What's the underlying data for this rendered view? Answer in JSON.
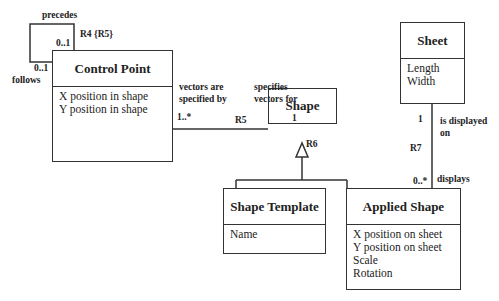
{
  "classes": {
    "control_point": {
      "name": "Control Point",
      "attributes": [
        "X position in shape",
        "Y position in shape"
      ]
    },
    "shape": {
      "name": "Shape",
      "attributes": []
    },
    "sheet": {
      "name": "Sheet",
      "attributes": [
        "Length",
        "Width"
      ]
    },
    "shape_template": {
      "name": "Shape Template",
      "attributes": [
        "Name"
      ]
    },
    "applied_shape": {
      "name": "Applied Shape",
      "attributes": [
        "X position on sheet",
        "Y position on sheet",
        "Scale",
        "Rotation"
      ]
    }
  },
  "associations": {
    "r4": {
      "id": "R4 {R5}",
      "role_a": "precedes",
      "mult_a": "0..1",
      "role_b": "follows",
      "mult_b": "0..1"
    },
    "r5": {
      "id": "R5",
      "role_a": "vectors are specified by",
      "role_a_l1": "vectors are",
      "role_a_l2": "specified by",
      "mult_a": "1..*",
      "role_b_l1": "specifies",
      "role_b_l2": "vectors for",
      "mult_b": "1"
    },
    "r6": {
      "id": "R6"
    },
    "r7": {
      "id": "R7",
      "role_a_l1": "is displayed",
      "role_a_l2": "on",
      "mult_a": "1",
      "role_b": "displays",
      "mult_b": "0..*"
    }
  }
}
